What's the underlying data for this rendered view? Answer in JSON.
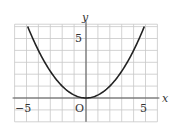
{
  "chart_data": {
    "type": "line",
    "title": "",
    "function": "y = x^2 / 4",
    "xlabel": "x",
    "ylabel": "y",
    "origin_label": "O",
    "xlim": [
      -6,
      6
    ],
    "ylim": [
      -2,
      6.2
    ],
    "grid": true,
    "grid_step": 1,
    "x_tick_labels": [
      {
        "value": -5,
        "label": "−5"
      },
      {
        "value": 5,
        "label": "5"
      }
    ],
    "y_tick_labels": [
      {
        "value": 5,
        "label": "5"
      }
    ],
    "series": [
      {
        "name": "y = x²/4",
        "x": [
          -4.9,
          -4,
          -3,
          -2,
          -1,
          0,
          1,
          2,
          3,
          4,
          4.9
        ],
        "y": [
          6.0,
          4,
          2.25,
          1,
          0.25,
          0,
          0.25,
          1,
          2.25,
          4,
          6.0
        ]
      }
    ],
    "colors": {
      "grid": "#c8c8c8",
      "axes": "#555555",
      "curve": "#222222"
    }
  }
}
